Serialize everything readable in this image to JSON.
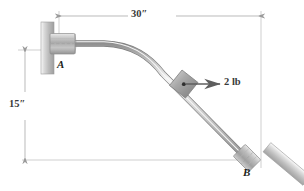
{
  "figure": {
    "type": "engineering-mechanics-free-body-diagram",
    "labels": {
      "support_a": "A",
      "support_b": "B",
      "horizontal_dimension": "30″",
      "vertical_dimension": "15″",
      "force": "2 lb"
    },
    "force": {
      "magnitude": "2 lb",
      "direction": "horizontal-right",
      "application_point": "collar-on-rod"
    },
    "dimensions": {
      "horizontal": {
        "value": "30″",
        "from": "A",
        "to": "B"
      },
      "vertical": {
        "value": "15″",
        "from": "A",
        "to": "B"
      }
    },
    "colors": {
      "line": "#6e6e6e",
      "text": "#231f20",
      "dim_line": "#b8b8b8",
      "metal_light": "#f2f2f2",
      "metal_mid": "#b9b9b9",
      "metal_dark": "#8a8a8a",
      "wall_light": "#efefef",
      "wall_dark": "#b5b5b5"
    }
  }
}
